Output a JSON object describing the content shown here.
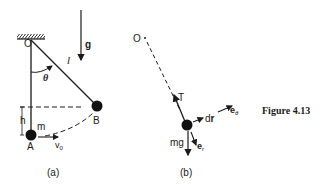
{
  "figure": {
    "caption": "Figure 4.13",
    "panel_a": {
      "label": "(a)",
      "pivot": "O",
      "length": "l",
      "angle": "θ",
      "gravity": "g",
      "height": "h",
      "mass": "m",
      "bottom_point": "A",
      "top_point": "B",
      "initial_velocity": "v",
      "initial_velocity_sub": "0"
    },
    "panel_b": {
      "label": "(b)",
      "pivot": "O",
      "tension": "T",
      "displacement": "dr",
      "displacement_prefix": "d",
      "displacement_bold": "r",
      "weight": "mg",
      "unit_r": "e",
      "unit_r_sub": "r",
      "unit_theta": "e",
      "unit_theta_sub": "θ"
    }
  }
}
